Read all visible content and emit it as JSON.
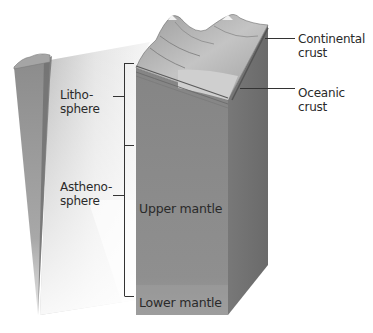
{
  "diagram": {
    "type": "earth-layers-cutaway",
    "labels": {
      "lithosphere": [
        "Litho-",
        "sphere"
      ],
      "asthenosphere": [
        "Astheno-",
        "sphere"
      ],
      "upper_mantle": "Upper mantle",
      "lower_mantle": "Lower mantle",
      "continental_crust": [
        "Continental",
        "crust"
      ],
      "oceanic_crust": [
        "Oceanic",
        "crust"
      ]
    },
    "colors": {
      "block_front": "#8a8a8a",
      "block_side": "#6e6e6e",
      "lower_mantle_band": "#9a9a9a",
      "terrain": "#b5b5b5",
      "bracket_line": "#333333",
      "text": "#2a2a2a"
    }
  }
}
